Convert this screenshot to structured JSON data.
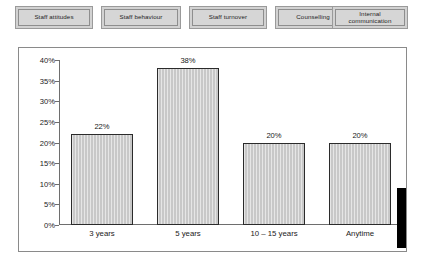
{
  "tabs": [
    {
      "label": "Staff attitudes"
    },
    {
      "label": "Staff behaviour"
    },
    {
      "label": "Staff turnover"
    },
    {
      "label": "Counselling"
    },
    {
      "label": "Internal\ncommunication"
    }
  ],
  "colors": {
    "bar_fill": "#c8c8c8",
    "bar_border": "#2b2b2b",
    "tab_face": "#d6d6d6",
    "frame_border": "#8a8a8a",
    "axis": "#6e6e6e",
    "edge_marker": "#000000"
  },
  "chart_data": {
    "type": "bar",
    "title": "",
    "xlabel": "",
    "ylabel": "",
    "categories": [
      "3 years",
      "5 years",
      "10 – 15 years",
      "Anytime"
    ],
    "values": [
      22,
      38,
      20,
      20
    ],
    "value_labels": [
      "22%",
      "38%",
      "20%",
      "20%"
    ],
    "ylim": [
      0,
      40
    ],
    "ytick_values": [
      0,
      5,
      10,
      15,
      20,
      25,
      30,
      35,
      40
    ],
    "ytick_labels": [
      "0%",
      "5%",
      "10%",
      "15%",
      "20%",
      "25%",
      "30%",
      "35%",
      "40%"
    ],
    "grid": false,
    "legend": "none"
  }
}
